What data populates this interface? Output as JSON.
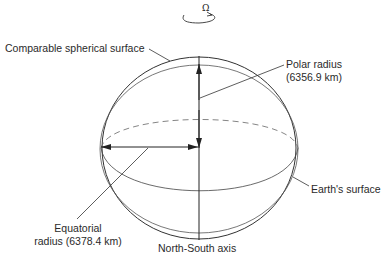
{
  "diagram": {
    "rotation_symbol": "Ω",
    "labels": {
      "comparable_sphere": "Comparable spherical surface",
      "polar_radius_line1": "Polar radius",
      "polar_radius_line2": "(6356.9 km)",
      "earth_surface": "Earth's surface",
      "equatorial_radius_line1": "Equatorial",
      "equatorial_radius_line2": "radius (6378.4 km)",
      "ns_axis": "North-South axis"
    },
    "values": {
      "polar_radius_km": 6356.9,
      "equatorial_radius_km": 6378.4
    },
    "colors": {
      "stroke": "#333333",
      "background": "#ffffff"
    }
  }
}
